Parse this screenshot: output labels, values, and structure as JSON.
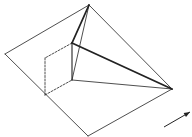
{
  "diagram": {
    "type": "geometric-line-drawing",
    "stroke_color": "#222222",
    "background": "#ffffff",
    "vertices": {
      "apex": [
        89,
        5
      ],
      "left": [
        5,
        54
      ],
      "right": [
        172,
        89
      ],
      "bottom": [
        88,
        136
      ],
      "inner_top": [
        72,
        43
      ],
      "inner_bottom": [
        72,
        80
      ],
      "hidden_top": [
        45,
        58
      ],
      "hidden_bottom": [
        45,
        95
      ]
    },
    "edges": [
      {
        "from": "left",
        "to": "apex",
        "style": "thin"
      },
      {
        "from": "apex",
        "to": "right",
        "style": "thin"
      },
      {
        "from": "right",
        "to": "bottom",
        "style": "thin"
      },
      {
        "from": "bottom",
        "to": "left",
        "style": "thin"
      },
      {
        "from": "apex",
        "to": "inner_top",
        "style": "thick"
      },
      {
        "from": "apex",
        "to": "inner_bottom",
        "style": "thin"
      },
      {
        "from": "inner_top",
        "to": "right",
        "style": "thick"
      },
      {
        "from": "inner_top",
        "to": "inner_bottom",
        "style": "medium"
      },
      {
        "from": "inner_bottom",
        "to": "right",
        "style": "thin"
      },
      {
        "from": "inner_top",
        "to": "hidden_top",
        "style": "dashed"
      },
      {
        "from": "hidden_top",
        "to": "hidden_bottom",
        "style": "dashed"
      },
      {
        "from": "hidden_bottom",
        "to": "inner_bottom",
        "style": "dashed"
      }
    ],
    "arrow": {
      "from": [
        164,
        127
      ],
      "to": [
        190,
        112
      ]
    }
  }
}
